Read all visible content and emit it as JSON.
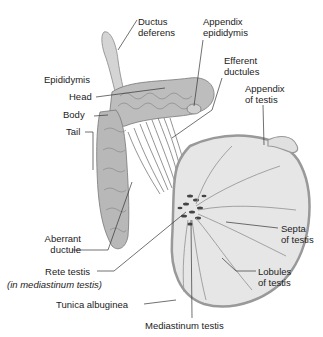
{
  "title": "",
  "labels": {
    "ductus_deferens": [
      "Ductus",
      "deferens"
    ],
    "appendix_epididymis": [
      "Appendix",
      "epididymis"
    ],
    "efferent_ductules": [
      "Efferent",
      "ductules"
    ],
    "appendix_of_testis": [
      "Appendix",
      "of testis"
    ],
    "epididymis": "Epididymis",
    "head": "Head",
    "body": "Body",
    "tail": "Tail",
    "aberrant_ductule": [
      "Aberrant",
      "ductule"
    ],
    "rete_testis": "Rete testis",
    "rete_testis_note": "(in mediastinum testis)",
    "tunica_albuginea": "Tunica albuginea",
    "mediastinum_testis": "Mediastinum testis",
    "septa_of_testis": [
      "Septa",
      "of testis"
    ],
    "lobules_of_testis": [
      "Lobules",
      "of testis"
    ]
  },
  "colors": {
    "line": "#333333",
    "tissue": "#bdbdbd",
    "tissue_dark": "#8a8a8a",
    "testis_fill": "#e6e6e6"
  }
}
